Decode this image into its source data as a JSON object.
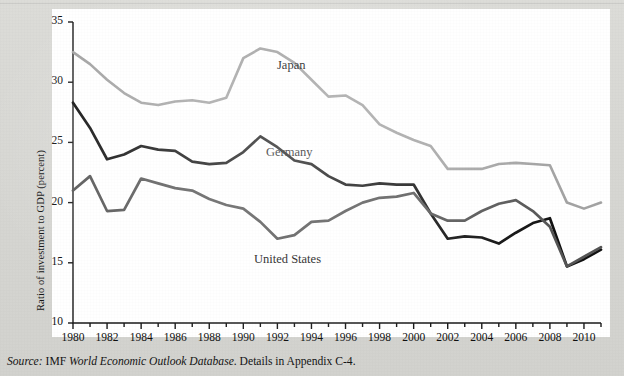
{
  "figure": {
    "background_color": "#ffffff",
    "page_color": "#d9d9d6"
  },
  "axes": {
    "ylabel": "Ratio of investment to GDP (percent)",
    "xlabel": "",
    "yticks": [
      "35",
      "30",
      "25",
      "20",
      "15",
      "10"
    ],
    "xticks": [
      "1980",
      "1982",
      "1984",
      "1986",
      "1988",
      "1990",
      "1992",
      "1994",
      "1996",
      "1998",
      "2000",
      "2002",
      "2004",
      "2006",
      "2008",
      "2010"
    ]
  },
  "series_labels": {
    "japan": "Japan",
    "germany": "Germany",
    "united_states": "United States"
  },
  "source": {
    "prefix": "Source:",
    "body_1": " IMF ",
    "italic_title": "World Economic Outlook Database",
    "body_2": ". Details in Appendix C-4."
  },
  "colors": {
    "japan": "#a3a3a3",
    "germany": "#111111",
    "united_states": "#555555",
    "axis": "#1a1a1a"
  },
  "chart_data": {
    "type": "line",
    "title": "",
    "xlabel": "",
    "ylabel": "Ratio of investment to GDP (percent)",
    "xlim": [
      1980,
      2011
    ],
    "ylim": [
      10,
      35
    ],
    "grid": false,
    "legend": "inline-annotations",
    "x": [
      1980,
      1981,
      1982,
      1983,
      1984,
      1985,
      1986,
      1987,
      1988,
      1989,
      1990,
      1991,
      1992,
      1993,
      1994,
      1995,
      1996,
      1997,
      1998,
      1999,
      2000,
      2001,
      2002,
      2003,
      2004,
      2005,
      2006,
      2007,
      2008,
      2009,
      2010,
      2011
    ],
    "series": [
      {
        "name": "Japan",
        "color": "#a3a3a3",
        "values": [
          32.5,
          31.5,
          30.2,
          29.1,
          28.3,
          28.1,
          28.4,
          28.5,
          28.3,
          28.7,
          32.0,
          32.8,
          32.5,
          31.6,
          30.2,
          28.8,
          28.9,
          28.1,
          26.5,
          25.8,
          25.2,
          24.7,
          22.8,
          22.8,
          22.8,
          23.2,
          23.3,
          23.2,
          23.1,
          20.0,
          19.5,
          20.0
        ]
      },
      {
        "name": "Germany",
        "color": "#111111",
        "values": [
          28.3,
          26.2,
          23.6,
          24.0,
          24.7,
          24.4,
          24.3,
          23.4,
          23.2,
          23.3,
          24.2,
          25.5,
          24.6,
          23.5,
          23.2,
          22.2,
          21.5,
          21.4,
          21.6,
          21.5,
          21.5,
          19.1,
          17.0,
          17.2,
          17.1,
          16.6,
          17.5,
          18.3,
          18.7,
          14.7,
          15.3,
          16.1
        ]
      },
      {
        "name": "United States",
        "color": "#555555",
        "values": [
          21.0,
          22.2,
          19.3,
          19.4,
          22.0,
          21.6,
          21.2,
          21.0,
          20.3,
          19.8,
          19.5,
          18.4,
          17.0,
          17.3,
          18.4,
          18.5,
          19.3,
          20.0,
          20.4,
          20.5,
          20.8,
          19.1,
          18.5,
          18.5,
          19.3,
          19.9,
          20.2,
          19.3,
          18.0,
          14.7,
          15.5,
          16.3
        ]
      }
    ]
  }
}
